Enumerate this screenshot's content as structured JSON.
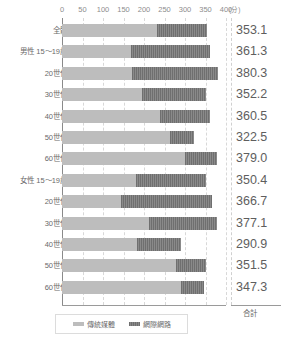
{
  "chart_data": {
    "type": "bar",
    "orientation": "horizontal",
    "stacked": true,
    "title": "",
    "xlabel": "(分)",
    "ylabel": "",
    "xlim": [
      0,
      400
    ],
    "xticks": [
      0,
      50,
      100,
      150,
      200,
      250,
      300,
      350,
      400
    ],
    "xtick_labels": [
      "0",
      "50",
      "100",
      "150",
      "200",
      "250",
      "300",
      "350",
      "400"
    ],
    "unit_label": "(分)",
    "grid": true,
    "legend_position": "bottom",
    "categories": [
      "全體",
      "男性 15～19歲",
      "20世代",
      "30世代",
      "40世代",
      "50世代",
      "60世代",
      "女性 15～19歲",
      "20世代",
      "30世代",
      "40世代",
      "50世代",
      "60世代"
    ],
    "series": [
      {
        "name": "傳統媒體",
        "color": "#bdbdbd",
        "values": [
          232.0,
          168.0,
          171.0,
          194.0,
          240.0,
          263.0,
          299.0,
          180.0,
          145.0,
          212.0,
          183.0,
          277.0,
          290.0
        ]
      },
      {
        "name": "網際網路",
        "color": "#7b7b7b",
        "values": [
          121.1,
          193.3,
          209.3,
          158.2,
          120.5,
          59.5,
          80.0,
          170.4,
          221.7,
          165.1,
          107.9,
          74.5,
          57.3
        ]
      }
    ],
    "totals": [
      353.1,
      361.3,
      380.3,
      352.2,
      360.5,
      322.5,
      379.0,
      350.4,
      366.7,
      377.1,
      290.9,
      351.5,
      347.3
    ],
    "total_column_header": "合計"
  },
  "legend": {
    "items": [
      {
        "label": "傳統媒體",
        "swatch": "legend-swatch-traditional-media"
      },
      {
        "label": "網際網路",
        "swatch": "legend-swatch-internet"
      }
    ]
  }
}
